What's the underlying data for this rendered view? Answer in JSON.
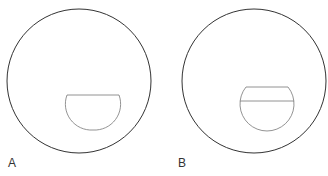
{
  "panels": [
    {
      "label": "A",
      "outer_circle": {
        "cx": 79,
        "cy": 81,
        "r": 72
      },
      "inner_shape": "semicircle-flat-top",
      "inner": {
        "top_y": 95,
        "left_x": 67,
        "right_x": 119,
        "cx": 93,
        "r": 26
      }
    },
    {
      "label": "B",
      "outer_circle": {
        "cx": 254,
        "cy": 81,
        "r": 72
      },
      "inner_shape": "truncated-circle-with-chord",
      "inner": {
        "top_y": 87,
        "chord_y": 101,
        "cx": 267,
        "cy": 105,
        "r": 27
      }
    }
  ],
  "colors": {
    "outer_stroke": "#333333",
    "inner_stroke": "#777777",
    "label": "#333333"
  }
}
